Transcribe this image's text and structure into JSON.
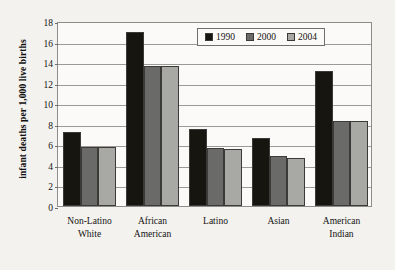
{
  "chart_data": {
    "type": "bar",
    "title": "",
    "xlabel": "",
    "ylabel": "infant deaths per 1,000 live births",
    "ylim": [
      0,
      18
    ],
    "ytick_step": 2,
    "yticks": [
      0,
      2,
      4,
      6,
      8,
      10,
      12,
      14,
      16,
      18
    ],
    "grid": true,
    "legend_position": "top-center",
    "categories": [
      "Non-Latino\nWhite",
      "African\nAmerican",
      "Latino",
      "Asian",
      "American\nIndian"
    ],
    "category_lines": [
      [
        "Non-Latino",
        "White"
      ],
      [
        "African",
        "American"
      ],
      [
        "Latino"
      ],
      [
        "Asian"
      ],
      [
        "American",
        "Indian"
      ]
    ],
    "series": [
      {
        "name": "1990",
        "color": "#16150f",
        "values": [
          7.2,
          16.9,
          7.5,
          6.6,
          13.1
        ]
      },
      {
        "name": "2000",
        "color": "#6a6a68",
        "values": [
          5.7,
          13.6,
          5.6,
          4.9,
          8.3
        ]
      },
      {
        "name": "2004",
        "color": "#a8a8a4",
        "values": [
          5.7,
          13.6,
          5.5,
          4.7,
          8.3
        ]
      }
    ]
  },
  "legend": {
    "items": [
      {
        "label": "1990",
        "color": "#16150f"
      },
      {
        "label": "2000",
        "color": "#6a6a68"
      },
      {
        "label": "2004",
        "color": "#a8a8a4"
      }
    ]
  },
  "colors": {
    "background": "#f4f2ef",
    "plot_background": "#fbfaf8",
    "axis": "#8e8d8b",
    "gridline": "#9b9a98",
    "text": "#131211"
  }
}
